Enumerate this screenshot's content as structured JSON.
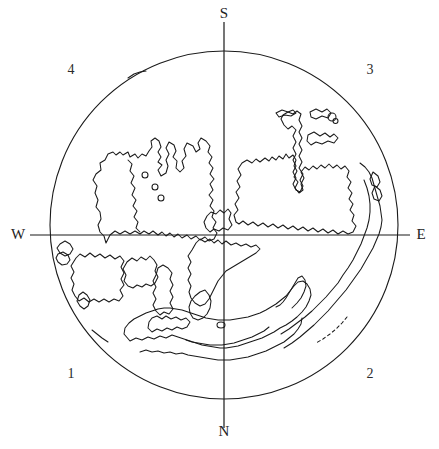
{
  "figure": {
    "type": "polar-projection-map",
    "background_color": "#ffffff",
    "line_color": "#1a1a1a",
    "title": ""
  },
  "projection": {
    "center_x": 224,
    "center_y": 225,
    "radius": 174,
    "outline_stroke_width": 1.1
  },
  "axes": {
    "vertical": {
      "x": 224,
      "y_top": 22,
      "y_bottom": 428,
      "stroke_width": 1.2
    },
    "horizontal": {
      "y": 235,
      "x_left": 30,
      "x_right": 410,
      "stroke_width": 1.2
    }
  },
  "cardinal_labels": {
    "south": "S",
    "north": "N",
    "west": "W",
    "east": "E"
  },
  "quadrant_labels": {
    "q1": "1",
    "q2": "2",
    "q3": "3",
    "q4": "4"
  },
  "chart_data": {
    "type": "map",
    "title": "",
    "xlabel": "",
    "ylabel": "",
    "grid": false,
    "legend": null,
    "annotations": [
      {
        "text": "S",
        "position": "top",
        "x": 224,
        "y": 14
      },
      {
        "text": "N",
        "position": "bottom",
        "x": 224,
        "y": 432
      },
      {
        "text": "W",
        "position": "left",
        "x": 18,
        "y": 235
      },
      {
        "text": "E",
        "position": "right",
        "x": 421,
        "y": 235
      },
      {
        "text": "4",
        "position": "top-left",
        "x": 71,
        "y": 70
      },
      {
        "text": "3",
        "position": "top-right",
        "x": 370,
        "y": 70
      },
      {
        "text": "1",
        "position": "bottom-left",
        "x": 71,
        "y": 374
      },
      {
        "text": "2",
        "position": "bottom-right",
        "x": 370,
        "y": 374
      }
    ],
    "features": [
      {
        "name": "circle-boundary",
        "kind": "outline",
        "dash": false,
        "path": "M 398 225 A 174 174 0 1 1 50 225 A 174 174 0 1 1 398 225 Z"
      },
      {
        "name": "northwest-landmass-main",
        "kind": "coastline",
        "dash": false,
        "path": "M 106 243 L 104 236 L 100 232 L 98 225 L 101 219 L 100 212 L 96 207 L 98 200 L 95 193 L 97 186 L 93 180 L 96 174 L 101 170 L 100 163 L 105 160 L 108 154 L 113 152 L 116 155 L 120 152 L 123 155 L 128 152 L 130 157 L 135 154 L 138 158 L 142 154 L 146 156 L 149 151 L 152 147 L 151 141 L 155 138 L 159 141 L 161 147 L 158 152 L 161 157 L 158 162 L 162 165 L 158 170 L 161 176 L 166 173 L 168 166 L 166 160 L 169 154 L 166 148 L 169 142 L 174 145 L 176 151 L 173 157 L 177 161 L 176 168 L 180 172 L 184 168 L 182 161 L 186 156 L 184 149 L 187 143 L 193 146 L 196 152 L 200 149 L 198 143 L 201 138 L 206 141 L 210 146 L 208 152 L 212 157 L 209 163 L 213 168 L 210 174 L 214 179 L 210 184 L 213 190 L 209 195 L 213 200 L 210 206 L 214 211 L 212 217 L 216 222 L 213 228 L 217 233 L 214 239 L 209 241 L 205 237 L 200 240 L 196 236 L 191 239 L 187 235 L 182 238 L 178 234 L 174 237 L 170 233 L 166 236 L 162 232 L 158 235 L 153 231 L 149 234 L 144 231 L 140 234 L 135 231 L 130 234 L 125 231 L 120 234 L 115 231 L 110 235 Z"
      },
      {
        "name": "northwest-inner-channel",
        "kind": "coastline",
        "dash": false,
        "path": "M 128 160 L 132 164 L 130 171 L 134 176 L 131 183 L 135 188 L 132 195 L 136 200 L 133 206 L 137 211 L 134 217 L 138 222 L 136 228 L 140 232"
      },
      {
        "name": "northwest-island-a",
        "kind": "island",
        "dash": false,
        "path": "M 142 175 A 3 3 0 1 1 148 175 A 3 3 0 1 1 142 175 Z"
      },
      {
        "name": "northwest-island-b",
        "kind": "island",
        "dash": false,
        "path": "M 152 187 A 3 3 0 1 1 158 187 A 3 3 0 1 1 152 187 Z"
      },
      {
        "name": "northwest-island-c",
        "kind": "island",
        "dash": false,
        "path": "M 158 198 A 3 3 0 1 1 164 198 A 3 3 0 1 1 158 198 Z"
      },
      {
        "name": "northeast-landmass-main",
        "kind": "coastline",
        "dash": false,
        "path": "M 236 222 L 234 215 L 238 210 L 235 204 L 239 198 L 236 192 L 240 187 L 237 181 L 241 175 L 238 169 L 242 163 L 247 160 L 252 163 L 256 159 L 260 162 L 265 158 L 269 161 L 272 157 L 276 160 L 279 156 L 283 159 L 286 154 L 289 158 L 293 155 L 296 160 L 294 166 L 297 171 L 294 177 L 298 182 L 295 188 L 299 193 L 303 190 L 301 184 L 304 178 L 301 172 L 305 167 L 309 170 L 313 166 L 317 169 L 321 165 L 325 168 L 329 164 L 333 168 L 337 165 L 341 169 L 345 166 L 349 171 L 347 177 L 351 182 L 348 188 L 352 193 L 349 199 L 353 204 L 350 210 L 354 215 L 352 221 L 356 226 L 353 232 L 348 234 L 343 231 L 338 234 L 333 230 L 328 233 L 323 229 L 318 232 L 313 228 L 308 231 L 303 227 L 298 230 L 293 226 L 288 229 L 283 225 L 278 228 L 273 224 L 268 227 L 263 223 L 258 226 L 253 222 L 248 225 L 243 221 L 239 224 Z"
      },
      {
        "name": "northeast-peninsula-strip",
        "kind": "coastline",
        "dash": false,
        "path": "M 283 115 L 288 112 L 293 114 L 297 111 L 301 114 L 299 120 L 302 126 L 299 132 L 302 138 L 299 144 L 302 150 L 299 156 L 302 162 L 299 168 L 303 174 L 300 180 L 303 186 L 300 192 L 296 190 L 293 184 L 296 178 L 293 172 L 296 166 L 293 160 L 296 154 L 293 148 L 296 142 L 293 136 L 296 130 L 292 126 L 288 129 L 284 125 L 281 119 Z"
      },
      {
        "name": "northeast-island-strip-upper",
        "kind": "island",
        "dash": false,
        "path": "M 276 113 L 282 110 L 288 112 L 293 110 L 296 113 L 291 116 L 285 115 L 279 117 Z"
      },
      {
        "name": "northeast-island-cluster-a",
        "kind": "island",
        "dash": false,
        "path": "M 310 112 L 316 109 L 322 112 L 327 109 L 331 113 L 328 118 L 322 116 L 316 119 L 311 117 Z"
      },
      {
        "name": "northeast-island-cluster-b",
        "kind": "island",
        "dash": false,
        "path": "M 328 117 A 4 4 0 1 1 336 117 A 4 4 0 1 1 328 117 Z"
      },
      {
        "name": "northeast-island-dot",
        "kind": "island",
        "dash": false,
        "path": "M 333 121 A 2.5 2.5 0 1 1 338 121 A 2.5 2.5 0 1 1 333 121 Z"
      },
      {
        "name": "northeast-island-cluster-c",
        "kind": "island",
        "dash": false,
        "path": "M 308 135 L 314 132 L 320 136 L 325 133 L 330 137 L 334 134 L 338 138 L 334 143 L 328 141 L 322 144 L 316 142 L 311 145 L 307 141 Z"
      },
      {
        "name": "east-rim-coastline",
        "kind": "coastline",
        "dash": false,
        "path": "M 360 163 L 365 167 L 369 172 L 372 178 L 374 185 L 376 192 L 378 199 L 380 206 L 381 213 L 382 220 L 381 227 L 379 234 L 376 241 L 373 248 L 369 255 L 365 262 L 361 269 L 356 276 L 351 283 L 346 290 L 340 297 L 334 304 L 328 311 L 321 318 L 314 325 L 307 331 L 300 337 L 292 343 L 284 348"
      },
      {
        "name": "east-rim-inner-coast",
        "kind": "coastline",
        "dash": false,
        "path": "M 364 180 L 367 188 L 369 196 L 370 204 L 370 212 L 369 220 L 367 228 L 364 236 L 361 244 L 357 252 L 353 260 L 348 268 L 343 275 L 338 283 L 332 290 L 326 297 L 319 304 L 312 311 L 305 317 L 297 323 L 289 329 L 281 334"
      },
      {
        "name": "east-rim-dashed-trace",
        "kind": "coastline",
        "dash": true,
        "path": "M 347 317 L 342 323 L 336 329 L 330 334 L 323 339 L 316 343"
      },
      {
        "name": "southwest-landmass-main",
        "kind": "coastline",
        "dash": false,
        "path": "M 76 258 L 80 254 L 85 257 L 90 253 L 95 257 L 100 254 L 105 258 L 110 255 L 115 259 L 120 256 L 124 261 L 121 267 L 124 273 L 121 279 L 124 285 L 120 290 L 123 296 L 119 301 L 114 299 L 109 302 L 104 299 L 99 302 L 94 299 L 89 302 L 84 298 L 79 301 L 75 296 L 72 290 L 74 284 L 71 278 L 74 272 L 71 266 Z"
      },
      {
        "name": "southwest-island-small",
        "kind": "island",
        "dash": false,
        "path": "M 79 295 L 83 292 L 87 295 L 90 300 L 88 306 L 84 309 L 80 306 L 77 301 Z"
      },
      {
        "name": "southwest-island-upper",
        "kind": "island",
        "dash": false,
        "path": "M 60 244 L 65 241 L 70 244 L 73 249 L 70 254 L 65 256 L 60 253 L 57 248 Z"
      },
      {
        "name": "southwest-island-edge",
        "kind": "island",
        "dash": false,
        "path": "M 58 254 L 63 252 L 68 255 L 70 260 L 67 264 L 62 265 L 58 262 L 56 258 Z"
      },
      {
        "name": "south-central-landmass",
        "kind": "coastline",
        "dash": false,
        "path": "M 127 262 L 132 258 L 137 261 L 141 257 L 146 260 L 150 256 L 154 260 L 157 265 L 155 271 L 158 277 L 155 283 L 151 286 L 146 284 L 142 287 L 137 285 L 133 288 L 128 286 L 124 281 L 126 275 L 123 269 Z"
      },
      {
        "name": "south-central-peninsula",
        "kind": "coastline",
        "dash": false,
        "path": "M 158 268 L 163 265 L 168 268 L 172 273 L 170 279 L 173 285 L 170 291 L 173 297 L 170 303 L 173 309 L 169 314 L 164 312 L 160 315 L 156 311 L 153 305 L 156 299 L 153 293 L 156 287 L 153 281 L 156 275 Z"
      },
      {
        "name": "central-landmass-upper",
        "kind": "coastline",
        "dash": false,
        "path": "M 204 222 L 207 216 L 211 212 L 216 214 L 220 210 L 224 213 L 228 209 L 231 213 L 229 219 L 232 225 L 228 230 L 223 228 L 219 231 L 214 229 L 210 232 L 206 228 Z"
      },
      {
        "name": "central-landmass-lower",
        "kind": "coastline",
        "dash": false,
        "path": "M 196 243 L 200 239 L 205 242 L 210 239 L 214 243 L 218 240 L 222 244 L 226 241 L 231 245 L 236 243 L 241 246 L 246 244 L 251 247 L 256 245 L 260 249 L 256 253 L 251 256 L 246 259 L 241 262 L 236 265 L 231 268 L 226 271 L 222 276 L 218 281 L 215 287 L 212 293 L 209 299 L 205 304 L 200 306 L 195 303 L 191 298 L 189 292 L 191 286 L 188 280 L 191 274 L 188 268 L 191 262 L 188 256 L 192 250 Z"
      },
      {
        "name": "central-landmass-tail",
        "kind": "coastline",
        "dash": false,
        "path": "M 205 290 L 209 295 L 211 301 L 210 308 L 207 314 L 203 318 L 198 320 L 193 318 L 190 313 L 189 307 L 191 301 L 195 296 L 200 292 Z"
      },
      {
        "name": "south-peninsula-tip",
        "kind": "coastline",
        "dash": false,
        "path": "M 152 318 L 157 316 L 162 319 L 166 316 L 171 319 L 176 317 L 181 320 L 186 318 L 190 322 L 187 327 L 182 329 L 177 327 L 172 330 L 167 328 L 162 331 L 157 329 L 152 332 L 148 328 L 149 322 Z"
      },
      {
        "name": "antarctic-coast-outer",
        "kind": "coastline",
        "dash": false,
        "path": "M 130 341 L 136 338 L 142 340 L 148 337 L 154 339 L 160 336 L 166 338 L 172 335 L 178 337 L 184 339 L 190 341 L 196 343 L 202 345 L 208 346 L 214 347 L 220 348 L 226 348 L 232 347 L 238 346 L 244 344 L 250 342 L 256 340 L 262 338 L 268 335 L 274 332 L 280 328 L 286 325 L 292 321 L 297 317 L 302 312 L 306 307 L 309 301 L 311 295 L 310 289 L 307 284 L 303 281 L 298 282 L 294 286 L 290 291 L 286 296 L 281 300 L 276 304 L 271 307 L 266 310 L 260 313 L 254 315 L 248 317 L 242 318 L 236 319 L 230 320 L 224 320 L 218 320 L 212 319 L 206 318 L 200 316 L 194 314 L 188 312 L 182 310 L 176 309 L 170 308 L 164 308 L 158 309 L 152 311 L 146 313 L 140 316 L 134 319 L 129 323 L 125 328 L 124 334 Z"
      },
      {
        "name": "antarctic-coast-inner",
        "kind": "coastline",
        "dash": false,
        "path": "M 140 352 L 146 350 L 152 352 L 158 351 L 164 353 L 170 352 L 176 354 L 182 353 L 188 355 L 194 356 L 200 357 L 206 358 L 212 359 L 218 360 L 224 360 L 230 360 L 236 359 L 242 358 L 248 357 L 254 355 L 260 353 L 266 351 L 272 348 L 278 345 L 284 342 L 289 338 L 294 334 L 298 329 L 301 324 L 302 318"
      },
      {
        "name": "antarctic-inlet-trace",
        "kind": "coastline",
        "dash": false,
        "path": "M 186 340 L 192 342 L 198 343 L 204 344 L 210 345 L 216 345 L 222 345 L 228 344 L 234 343 L 240 341 L 246 339 L 252 337 L 258 334 L 264 331 L 269 327"
      },
      {
        "name": "antarctic-island-small",
        "kind": "island",
        "dash": false,
        "path": "M 217 325 A 4 3 0 1 1 225 325 A 4 3 0 1 1 217 325 Z"
      },
      {
        "name": "antarctic-peninsula-hook",
        "kind": "coastline",
        "dash": false,
        "path": "M 292 308 L 297 303 L 301 298 L 304 292 L 306 286 L 305 280 L 302 276 L 298 278 L 295 283 L 292 288 L 289 293 L 286 298 L 283 302 L 280 305 L 276 307"
      },
      {
        "name": "southwest-rim-mark",
        "kind": "coastline",
        "dash": false,
        "path": "M 92 330 L 97 334 L 102 338 L 108 342"
      },
      {
        "name": "northwest-rim-mark",
        "kind": "coastline",
        "dash": false,
        "path": "M 128 78 L 134 74 L 140 72 L 146 71"
      },
      {
        "name": "east-rim-notch-a",
        "kind": "coastline",
        "dash": false,
        "path": "M 373 172 L 378 176 L 380 182 L 377 187 L 372 185 L 370 179 Z"
      },
      {
        "name": "east-rim-notch-b",
        "kind": "coastline",
        "dash": false,
        "path": "M 375 186 L 380 190 L 382 196 L 379 201 L 374 199 L 372 193 Z"
      }
    ]
  }
}
